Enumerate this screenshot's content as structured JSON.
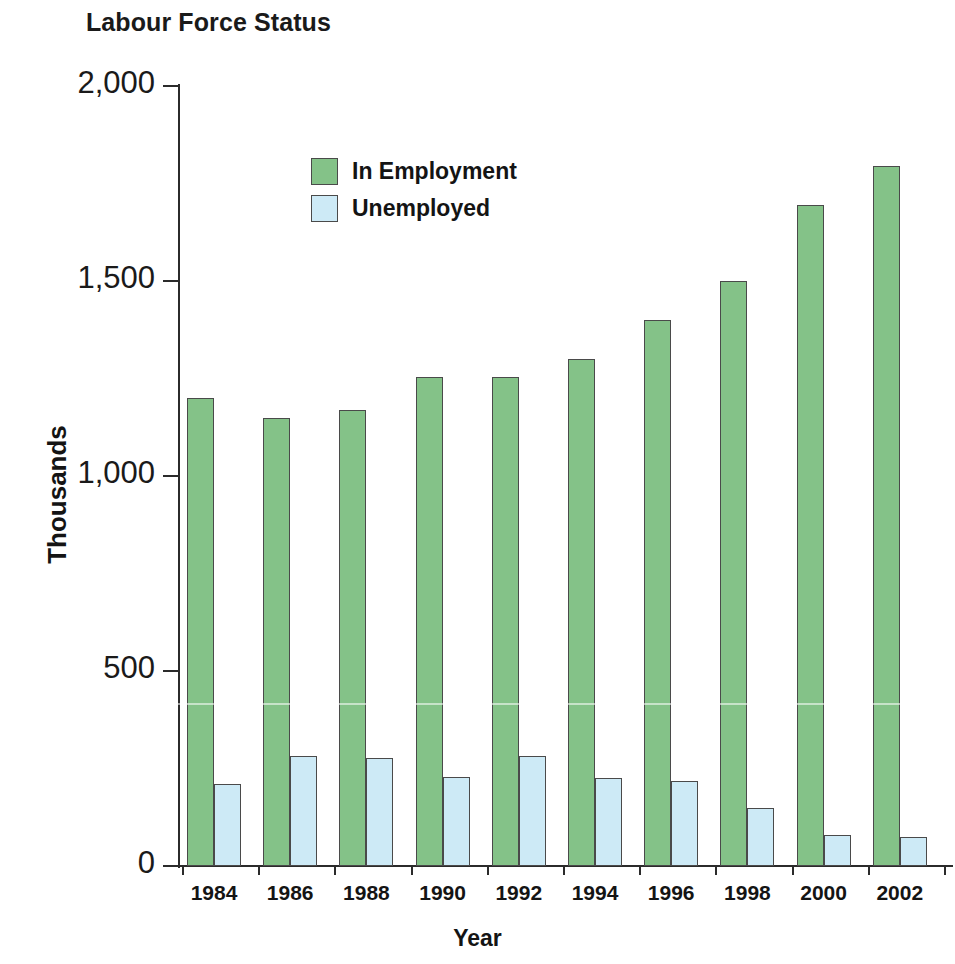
{
  "chart_data": {
    "type": "bar",
    "title": "Labour Force Status",
    "xlabel": "Year",
    "ylabel": "Thousands",
    "categories": [
      "1984",
      "1986",
      "1988",
      "1990",
      "1992",
      "1994",
      "1996",
      "1998",
      "2000",
      "2002"
    ],
    "series": [
      {
        "name": "In Employment",
        "color": "#84c288",
        "values": [
          1200,
          1150,
          1170,
          1255,
          1255,
          1300,
          1400,
          1500,
          1695,
          1795
        ]
      },
      {
        "name": "Unemployed",
        "color": "#cdeaf6",
        "values": [
          210,
          282,
          277,
          228,
          282,
          226,
          218,
          150,
          80,
          75
        ]
      }
    ],
    "ylim": [
      0,
      2000
    ],
    "y_ticks": [
      0,
      500,
      1000,
      1500,
      2000
    ],
    "y_tick_labels": [
      "0",
      "500",
      "1,000",
      "1,500",
      "2,000"
    ],
    "grid": false,
    "legend_position": "top-left-inside"
  },
  "legend": {
    "entries": [
      {
        "label": "In Employment",
        "swatch": "employed"
      },
      {
        "label": "Unemployed",
        "swatch": "unemployed"
      }
    ]
  }
}
